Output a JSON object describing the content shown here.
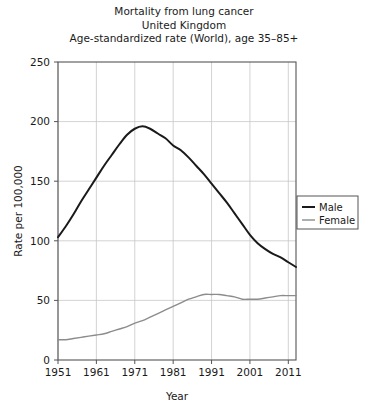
{
  "chart_data": {
    "type": "line",
    "title": "Mortality from lung cancer",
    "title_lines": [
      "Mortality from lung cancer",
      "United Kingdom",
      "Age-standardized rate (World), age 35–85+"
    ],
    "subtitle": "United Kingdom",
    "annotation": "Age-standardized rate (World), age 35–85+",
    "xlabel": "Year",
    "ylabel": "Rate per 100,000",
    "xlim": [
      1951,
      2013
    ],
    "ylim": [
      0,
      250
    ],
    "xticks": [
      1951,
      1961,
      1971,
      1981,
      1991,
      2001,
      2011
    ],
    "xtick_labels": [
      "1951",
      "1961",
      "1971",
      "1981",
      "1991",
      "2001",
      "2011"
    ],
    "yticks": [
      0,
      50,
      100,
      150,
      200,
      250
    ],
    "ytick_labels": [
      "0",
      "50",
      "100",
      "150",
      "200",
      "250"
    ],
    "grid": true,
    "grid_color": "#c8c8c8",
    "legend_position": "right",
    "series": [
      {
        "name": "Male",
        "color": "#1a1a1a",
        "width": 2.0,
        "x": [
          1951,
          1953,
          1955,
          1957,
          1959,
          1961,
          1963,
          1965,
          1967,
          1969,
          1971,
          1973,
          1975,
          1977,
          1979,
          1981,
          1983,
          1985,
          1987,
          1989,
          1991,
          1993,
          1995,
          1997,
          1999,
          2001,
          2003,
          2005,
          2007,
          2009,
          2011,
          2013
        ],
        "values": [
          103,
          112,
          122,
          133,
          143,
          153,
          163,
          172,
          181,
          189,
          194,
          196,
          194,
          190,
          186,
          180,
          176,
          170,
          163,
          156,
          148,
          140,
          132,
          123,
          114,
          105,
          98,
          93,
          89,
          86,
          82,
          78
        ]
      },
      {
        "name": "Female",
        "color": "#8c8c8c",
        "width": 1.4,
        "x": [
          1951,
          1953,
          1955,
          1957,
          1959,
          1961,
          1963,
          1965,
          1967,
          1969,
          1971,
          1973,
          1975,
          1977,
          1979,
          1981,
          1983,
          1985,
          1987,
          1989,
          1991,
          1993,
          1995,
          1997,
          1999,
          2001,
          2003,
          2005,
          2007,
          2009,
          2011,
          2013
        ],
        "values": [
          17,
          17,
          18,
          19,
          20,
          21,
          22,
          24,
          26,
          28,
          31,
          33,
          36,
          39,
          42,
          45,
          48,
          51,
          53,
          55,
          55,
          55,
          54,
          53,
          51,
          51,
          51,
          52,
          53,
          54,
          54,
          54
        ]
      }
    ],
    "legend_entries": [
      {
        "label": "Male",
        "color": "#1a1a1a",
        "width": 2.0
      },
      {
        "label": "Female",
        "color": "#8c8c8c",
        "width": 1.4
      }
    ]
  }
}
